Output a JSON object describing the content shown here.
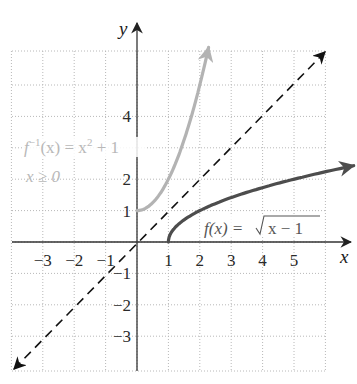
{
  "chart_data": {
    "type": "line",
    "title": "",
    "xlabel": "x",
    "ylabel": "y",
    "xlim": [
      -4,
      6
    ],
    "ylim": [
      -4,
      6
    ],
    "grid": true,
    "x_ticks": [
      "−3",
      "−2",
      "−1",
      "1",
      "2",
      "3",
      "4",
      "5"
    ],
    "y_ticks": [
      "4",
      "2",
      "1",
      "−1",
      "−2",
      "−3"
    ],
    "series": [
      {
        "name": "f(x) = √(x − 1)",
        "style": "solid dark gray, arrow at end",
        "color": "#555555",
        "x": [
          1,
          1.25,
          2,
          3,
          4,
          5,
          6
        ],
        "values": [
          0,
          0.5,
          1,
          1.41,
          1.73,
          2,
          2.24
        ]
      },
      {
        "name": "f⁻¹(x) = x² + 1, x ≥ 0",
        "style": "solid light gray, arrow at end",
        "color": "#b5b5b5",
        "x": [
          0,
          0.5,
          1,
          1.5,
          2,
          2.3
        ],
        "values": [
          1,
          1.25,
          2,
          3.25,
          5,
          6.0
        ]
      },
      {
        "name": "y = x",
        "style": "dashed black, arrows both ends",
        "color": "#111111",
        "x": [
          -4,
          6
        ],
        "values": [
          -4,
          6
        ]
      }
    ]
  },
  "labels": {
    "x_axis": "x",
    "y_axis": "y",
    "f_label_prefix": "f(x) = ",
    "f_label_radicand": "x − 1",
    "inverse_label_line1_f": "f",
    "inverse_label_line1_sup": "−1",
    "inverse_label_line1_rest": "(x) = x",
    "inverse_label_line1_sq": "2",
    "inverse_label_line1_tail": " + 1",
    "inverse_label_line2": "x ≥ 0"
  },
  "ticks": {
    "x": [
      {
        "label": "−3",
        "value": -3
      },
      {
        "label": "−2",
        "value": -2
      },
      {
        "label": "−1",
        "value": -1
      },
      {
        "label": "1",
        "value": 1
      },
      {
        "label": "2",
        "value": 2
      },
      {
        "label": "3",
        "value": 3
      },
      {
        "label": "4",
        "value": 4
      },
      {
        "label": "5",
        "value": 5
      }
    ],
    "y": [
      {
        "label": "4",
        "value": 4
      },
      {
        "label": "2",
        "value": 2
      },
      {
        "label": "1",
        "value": 1
      },
      {
        "label": "−1",
        "value": -1
      },
      {
        "label": "−2",
        "value": -2
      },
      {
        "label": "−3",
        "value": -3
      }
    ]
  },
  "colors": {
    "grid": "#b0b0b0",
    "axis": "#333333",
    "f_curve": "#4d4d4d",
    "inverse_curve": "#b3b3b3",
    "identity_line": "#111111"
  }
}
